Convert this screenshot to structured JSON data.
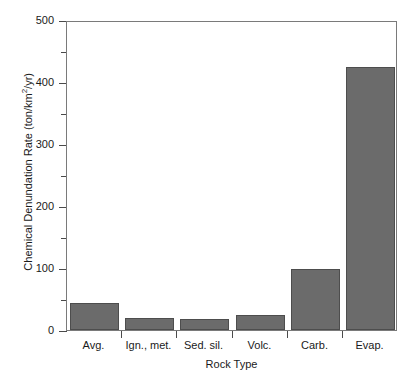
{
  "chart_data": {
    "type": "bar",
    "title": "",
    "categories": [
      "Avg.",
      "Ign., met.",
      "Sed. sil.",
      "Volc.",
      "Carb.",
      "Evap."
    ],
    "values": [
      44,
      19,
      18,
      24,
      98,
      424
    ],
    "xlabel": "Rock Type",
    "ylabel": "Chemical Denundation Rate (ton/km2/yr)",
    "ylabel_main": "Chemical Denundation Rate (ton/km",
    "ylabel_sup": "2",
    "ylabel_tail": "/yr)",
    "ylim": [
      0,
      500
    ],
    "ytick_major": [
      0,
      100,
      200,
      300,
      400,
      500
    ],
    "ytick_major_labels": [
      "0",
      "100",
      "200",
      "300",
      "400",
      "500"
    ],
    "ytick_minor": [
      50,
      150,
      250,
      350,
      450
    ],
    "grid": false,
    "legend": false,
    "bar_color": "#6b6b6b",
    "bar_edge_color": "#4d4d4d",
    "axis_color": "#7a7a7a",
    "background": "#ffffff"
  }
}
